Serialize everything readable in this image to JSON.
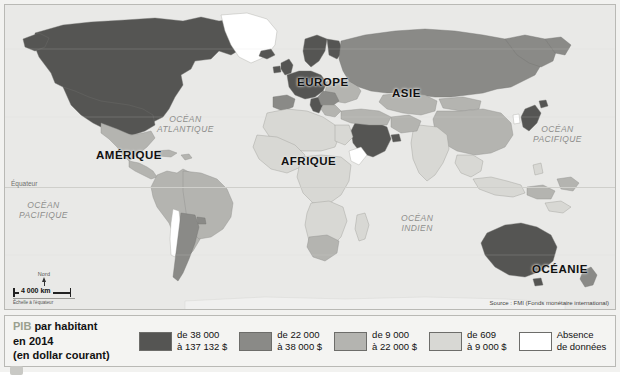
{
  "map": {
    "continents": [
      {
        "name": "AMERIQUE",
        "label": "AMÉRIQUE",
        "x": 95,
        "y": 148,
        "size": 11.5
      },
      {
        "name": "EUROPE",
        "label": "EUROPE",
        "x": 296,
        "y": 75,
        "size": 11.5
      },
      {
        "name": "ASIE",
        "label": "ASIE",
        "x": 391,
        "y": 86,
        "size": 11.5
      },
      {
        "name": "AFRIQUE",
        "label": "AFRIQUE",
        "x": 280,
        "y": 154,
        "size": 11.5
      },
      {
        "name": "OCEANIE",
        "label": "OCÉANIE",
        "x": 531,
        "y": 262,
        "size": 11.5
      }
    ],
    "oceans": [
      {
        "name": "ocean-atlantique",
        "line1": "OCÉAN",
        "line2": "ATLANTIQUE",
        "x": 166,
        "y": 114
      },
      {
        "name": "ocean-pacifique-ouest",
        "line1": "OCÉAN",
        "line2": "PACIFIQUE",
        "x": 22,
        "y": 200
      },
      {
        "name": "ocean-pacifique-est",
        "line1": "OCÉAN",
        "line2": "PACIFIQUE",
        "x": 536,
        "y": 124
      },
      {
        "name": "ocean-indien",
        "line1": "OCÉAN",
        "line2": "INDIEN",
        "x": 403,
        "y": 213
      }
    ],
    "equator_label": "Équateur",
    "north_label": "Nord",
    "scale_value": "4 000 km",
    "scale_note": "Échelle à l'équateur",
    "source": "Source : FMI (Fonds monétaire international)"
  },
  "legend": {
    "title_line1_accent": "PIB",
    "title_line1_rest": " par habitant",
    "title_line2": "en 2014",
    "title_line3": "(en dollar courant)",
    "classes": [
      {
        "name": "class-1",
        "line1": "de 38 000",
        "line2": "à 137 132 $",
        "color": "#555553"
      },
      {
        "name": "class-2",
        "line1": "de 22 000",
        "line2": "à 38 000 $",
        "color": "#8a8a87"
      },
      {
        "name": "class-3",
        "line1": "de 9 000",
        "line2": "à 22 000 $",
        "color": "#b4b4b0"
      },
      {
        "name": "class-4",
        "line1": "de 609",
        "line2": "à 9 000 $",
        "color": "#d8d8d4"
      },
      {
        "name": "class-5",
        "line1": "Absence",
        "line2": "de données",
        "color": "#ffffff"
      }
    ]
  },
  "palette": {
    "class1": "#555553",
    "class2": "#8a8a87",
    "class3": "#b4b4b0",
    "class4": "#d8d8d4",
    "nodata": "#ffffff",
    "ocean": "#e9e9e7",
    "border": "#9a9a96"
  }
}
